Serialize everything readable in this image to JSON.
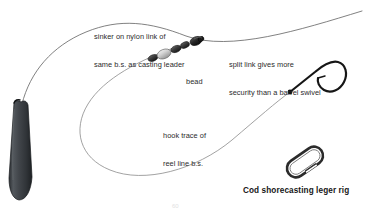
{
  "figure": {
    "caption": "Cod shorecasting leger rig",
    "page_number": "60",
    "background_color": "#ffffff",
    "line_color": "#555555",
    "ink_color": "#1d1d1d",
    "text_color": "#2b2b2b"
  },
  "annotations": [
    {
      "id": "sinker-label",
      "lines": [
        "sinker on nylon link of",
        "same b.s. as casting leader"
      ]
    },
    {
      "id": "split-link-label",
      "lines": [
        "split link gives more",
        "security than a barrel swivel"
      ]
    },
    {
      "id": "bead-label",
      "lines": [
        "bead"
      ]
    },
    {
      "id": "hook-trace-label",
      "lines": [
        "hook trace of",
        "reel line b.s."
      ]
    }
  ],
  "components": [
    {
      "id": "sinker",
      "name": "torpedo-lead-sinker",
      "color": "#3f4246"
    },
    {
      "id": "casting-leader",
      "name": "casting-leader-line",
      "color": "#555555"
    },
    {
      "id": "hook-trace",
      "name": "hook-trace-line",
      "color": "#777777"
    },
    {
      "id": "bead",
      "name": "bead",
      "color": "#d8d8d8"
    },
    {
      "id": "beads-stack",
      "name": "bead-stack",
      "color": "#4a4a4a"
    },
    {
      "id": "swivel",
      "name": "barrel-swivel",
      "color": "#2a2a2a"
    },
    {
      "id": "hook",
      "name": "fishing-hook",
      "color": "#161616"
    },
    {
      "id": "split-link",
      "name": "split-link-ring",
      "color": "#303030"
    }
  ]
}
